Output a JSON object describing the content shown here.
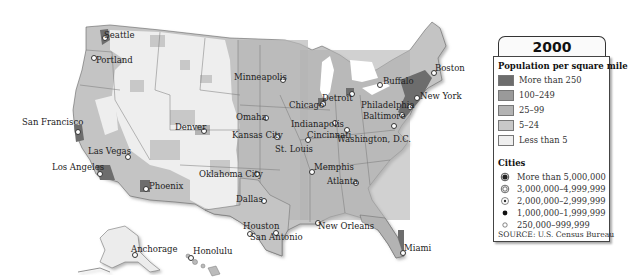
{
  "legend": {
    "year": "2000",
    "density_title": "Population per square mile",
    "density_classes": [
      {
        "label": "More than 250",
        "color": "#6d6d6d"
      },
      {
        "label": "100–249",
        "color": "#9a9a9a"
      },
      {
        "label": "25–99",
        "color": "#b3b3b3"
      },
      {
        "label": "5–24",
        "color": "#c8c8c8"
      },
      {
        "label": "Less than 5",
        "color": "#efefef"
      }
    ],
    "cities_title": "Cities",
    "city_classes": [
      {
        "label": "More than 5,000,000",
        "symbol": "ring-filled-large"
      },
      {
        "label": "3,000,000–4,999,999",
        "symbol": "double-ring"
      },
      {
        "label": "2,000,000–2,999,999",
        "symbol": "ring-dot"
      },
      {
        "label": "1,000,000–1,999,999",
        "symbol": "filled-dot"
      },
      {
        "label": "250,000–999,999",
        "symbol": "open-dot"
      }
    ],
    "source": "SOURCE: U.S. Census Bureau"
  },
  "cities": [
    {
      "name": "Seattle",
      "x": 104,
      "y": 37,
      "lx": 104,
      "ly": 31
    },
    {
      "name": "Portland",
      "x": 93,
      "y": 57,
      "lx": 96,
      "ly": 56
    },
    {
      "name": "San Francisco",
      "x": 77,
      "y": 131,
      "lx": 22,
      "ly": 118
    },
    {
      "name": "Las Vegas",
      "x": 127,
      "y": 156,
      "lx": 88,
      "ly": 147
    },
    {
      "name": "Los Angeles",
      "x": 99,
      "y": 173,
      "lx": 52,
      "ly": 163
    },
    {
      "name": "Phoenix",
      "x": 145,
      "y": 188,
      "lx": 149,
      "ly": 182
    },
    {
      "name": "Denver",
      "x": 203,
      "y": 130,
      "lx": 175,
      "ly": 123
    },
    {
      "name": "Minneapolis",
      "x": 282,
      "y": 79,
      "lx": 234,
      "ly": 73
    },
    {
      "name": "Omaha",
      "x": 265,
      "y": 117,
      "lx": 236,
      "ly": 113
    },
    {
      "name": "Kansas City",
      "x": 276,
      "y": 136,
      "lx": 232,
      "ly": 131
    },
    {
      "name": "Oklahoma City",
      "x": 256,
      "y": 173,
      "lx": 199,
      "ly": 170
    },
    {
      "name": "Dallas",
      "x": 263,
      "y": 200,
      "lx": 236,
      "ly": 195
    },
    {
      "name": "Houston",
      "x": 275,
      "y": 232,
      "lx": 243,
      "ly": 222
    },
    {
      "name": "San Antonio",
      "x": 249,
      "y": 233,
      "lx": 250,
      "ly": 233
    },
    {
      "name": "Chicago",
      "x": 322,
      "y": 103,
      "lx": 289,
      "ly": 101
    },
    {
      "name": "Detroit",
      "x": 351,
      "y": 93,
      "lx": 322,
      "ly": 94
    },
    {
      "name": "St. Louis",
      "x": 307,
      "y": 139,
      "lx": 275,
      "ly": 145
    },
    {
      "name": "Indianapolis",
      "x": 334,
      "y": 122,
      "lx": 291,
      "ly": 120
    },
    {
      "name": "Cincinnati",
      "x": 346,
      "y": 129,
      "lx": 307,
      "ly": 131
    },
    {
      "name": "Washington, D.C.",
      "x": 393,
      "y": 125,
      "lx": 337,
      "ly": 135
    },
    {
      "name": "Memphis",
      "x": 311,
      "y": 171,
      "lx": 314,
      "ly": 163
    },
    {
      "name": "Atlanta",
      "x": 355,
      "y": 182,
      "lx": 327,
      "ly": 177
    },
    {
      "name": "New Orleans",
      "x": 317,
      "y": 222,
      "lx": 318,
      "ly": 222
    },
    {
      "name": "Miami",
      "x": 402,
      "y": 252,
      "lx": 404,
      "ly": 244
    },
    {
      "name": "Buffalo",
      "x": 379,
      "y": 84,
      "lx": 383,
      "ly": 77
    },
    {
      "name": "Boston",
      "x": 433,
      "y": 72,
      "lx": 435,
      "ly": 64
    },
    {
      "name": "New York",
      "x": 416,
      "y": 97,
      "lx": 420,
      "ly": 92
    },
    {
      "name": "Philadelphia",
      "x": 409,
      "y": 106,
      "lx": 361,
      "ly": 101
    },
    {
      "name": "Baltimore",
      "x": 401,
      "y": 114,
      "lx": 363,
      "ly": 112
    },
    {
      "name": "Anchorage",
      "x": 134,
      "y": 254,
      "lx": 131,
      "ly": 245
    },
    {
      "name": "Honolulu",
      "x": 190,
      "y": 257,
      "lx": 193,
      "ly": 247
    }
  ]
}
